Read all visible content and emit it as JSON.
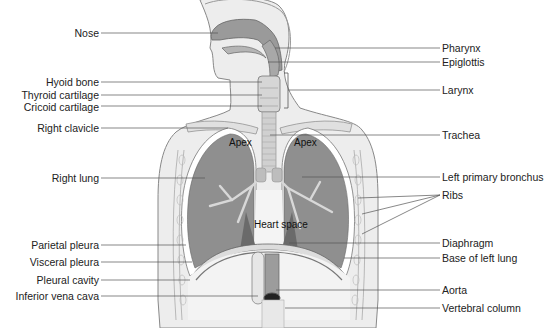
{
  "diagram": {
    "left_labels": [
      {
        "id": "nose",
        "text": "Nose",
        "y": 33,
        "line_end": 248
      },
      {
        "id": "hyoid-bone",
        "text": "Hyoid bone",
        "y": 82,
        "line_end": 262
      },
      {
        "id": "thyroid-cartilage",
        "text": "Thyroid cartilage",
        "y": 95,
        "line_end": 265
      },
      {
        "id": "cricoid-cartilage",
        "text": "Cricoid cartilage",
        "y": 108,
        "line_end": 265
      },
      {
        "id": "right-clavicle",
        "text": "Right clavicle",
        "y": 128,
        "line_end": 228
      },
      {
        "id": "right-lung",
        "text": "Right lung",
        "y": 178,
        "line_end": 205
      },
      {
        "id": "parietal-pleura",
        "text": "Parietal pleura",
        "y": 245,
        "line_end": 184
      },
      {
        "id": "visceral-pleura",
        "text": "Visceral pleura",
        "y": 262,
        "line_end": 192
      },
      {
        "id": "pleural-cavity",
        "text": "Pleural cavity",
        "y": 280,
        "line_end": 190
      },
      {
        "id": "inferior-vena-cava",
        "text": "Inferior vena cava",
        "y": 296,
        "line_end": 258
      }
    ],
    "right_labels": [
      {
        "id": "pharynx",
        "text": "Pharynx",
        "y": 48,
        "line_start": 275
      },
      {
        "id": "epiglottis",
        "text": "Epiglottis",
        "y": 62,
        "line_start": 268
      },
      {
        "id": "larynx",
        "text": "Larynx",
        "y": 90,
        "line_start": 288
      },
      {
        "id": "trachea",
        "text": "Trachea",
        "y": 135,
        "line_start": 270
      },
      {
        "id": "left-primary-bronchus",
        "text": "Left primary bronchus",
        "y": 177,
        "line_start": 302
      },
      {
        "id": "ribs",
        "text": "Ribs",
        "y": 195,
        "line_start": 358
      },
      {
        "id": "diaphragm",
        "text": "Diaphragm",
        "y": 243,
        "line_start": 289
      },
      {
        "id": "base-of-left-lung",
        "text": "Base of left lung",
        "y": 258,
        "line_start": 356
      },
      {
        "id": "aorta",
        "text": "Aorta",
        "y": 290,
        "line_start": 276
      },
      {
        "id": "vertebral-column",
        "text": "Vertebral column",
        "y": 308,
        "line_start": 285
      }
    ],
    "inner_labels": [
      {
        "id": "apex-right",
        "text": "Apex",
        "x": 231,
        "y": 143
      },
      {
        "id": "apex-left",
        "text": "Apex",
        "x": 294,
        "y": 143
      },
      {
        "id": "heart-space",
        "text": "Heart space",
        "x": 254,
        "y": 225
      }
    ],
    "colors": {
      "line": "#555555",
      "lung_fill": "#8f8f8f",
      "body_fill": "#ededed",
      "outline": "#777777",
      "text": "#222222",
      "nasal_fill": "#9a9a9a"
    }
  }
}
